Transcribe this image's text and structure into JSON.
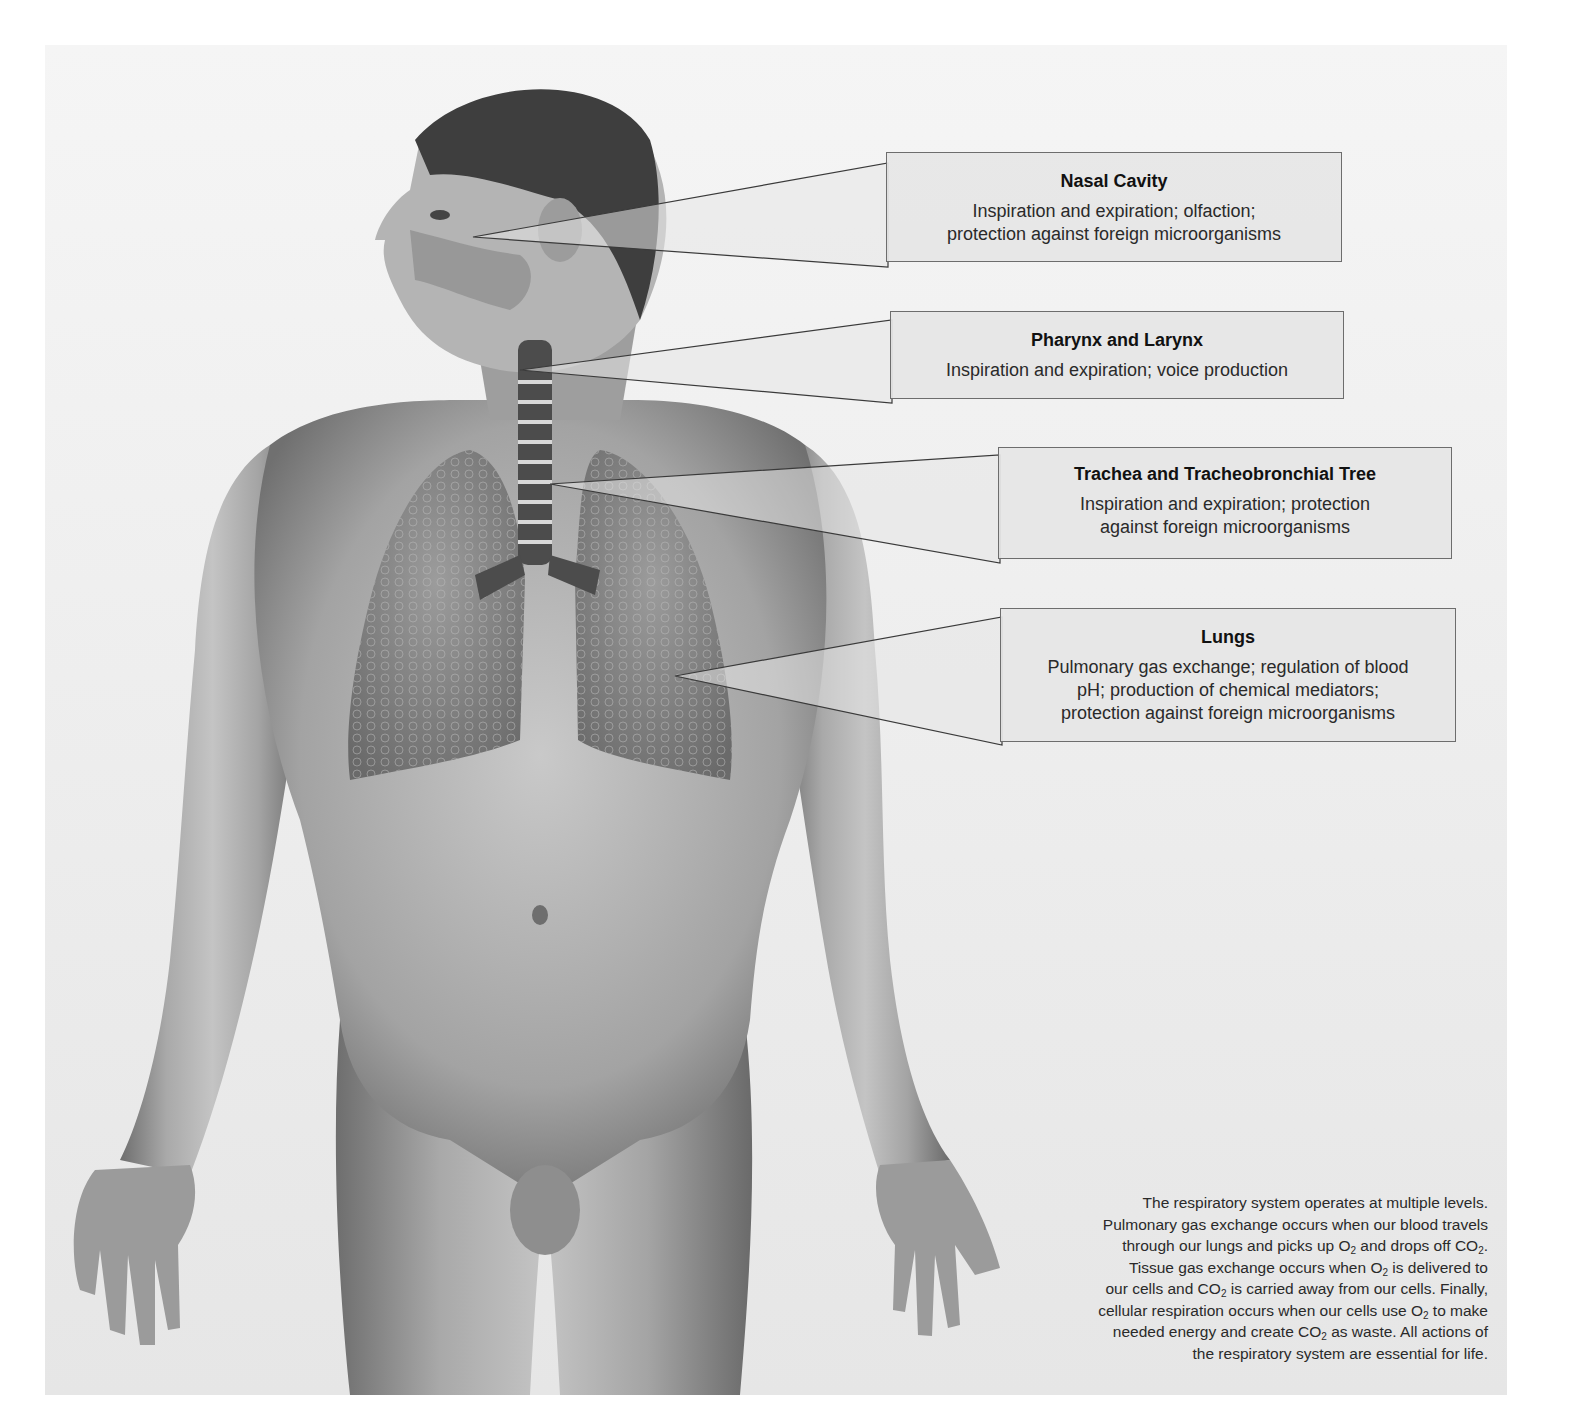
{
  "figure": {
    "colors": {
      "panel": "#ededed",
      "callout_fill": "#e6e6e6",
      "callout_border": "#6d6d6d",
      "text": "#1e1e1e"
    }
  },
  "callouts": [
    {
      "title": "Nasal Cavity",
      "lines": [
        "Inspiration and expiration; olfaction;",
        "protection against foreign microorganisms"
      ]
    },
    {
      "title": "Pharynx and Larynx",
      "lines": [
        "Inspiration and expiration; voice production"
      ]
    },
    {
      "title": "Trachea and Tracheobronchial Tree",
      "lines": [
        "Inspiration and expiration; protection",
        "against foreign microorganisms"
      ]
    },
    {
      "title": "Lungs",
      "lines": [
        "Pulmonary gas exchange; regulation of blood",
        "pH; production of chemical mediators;",
        "protection against foreign microorganisms"
      ]
    }
  ],
  "caption": {
    "l1": "The respiratory system operates at multiple levels.",
    "l2": "Pulmonary gas exchange occurs when our blood travels",
    "l3a": "through our lungs and picks up O",
    "l3b": " and drops off CO",
    "l3c": ".",
    "l4a": "Tissue gas exchange occurs when O",
    "l4b": " is delivered to",
    "l5a": "our cells and CO",
    "l5b": " is carried away from our cells. Finally,",
    "l6a": "cellular respiration occurs when our cells use O",
    "l6b": " to make",
    "l7a": "needed energy and create CO",
    "l7b": " as waste. All actions of",
    "l8": "the respiratory system are essential for life.",
    "sub": "2"
  }
}
